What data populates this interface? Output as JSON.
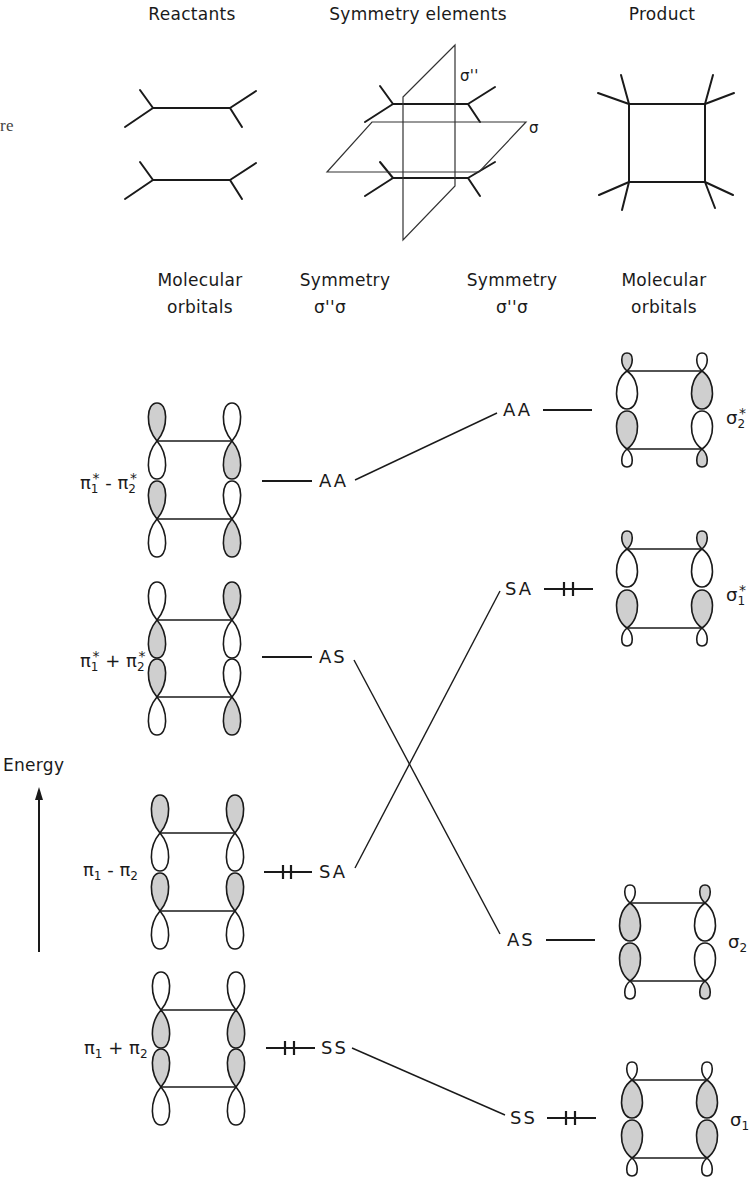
{
  "header": {
    "reactants": "Reactants",
    "symmetry_elements": "Symmetry elements",
    "product": "Product",
    "clipped_margin_text": "re"
  },
  "planes": {
    "sigma_double_prime": "σ''",
    "sigma": "σ"
  },
  "column_headers": {
    "left_mo_line1": "Molecular",
    "left_mo_line2": "orbitals",
    "left_sym_line1": "Symmetry",
    "left_sym_line2": "σ''σ",
    "right_sym_line1": "Symmetry",
    "right_sym_line2": "σ''σ",
    "right_mo_line1": "Molecular",
    "right_mo_line2": "orbitals"
  },
  "axis": {
    "label": "Energy"
  },
  "reactant_levels": [
    {
      "mo_base": "π",
      "sub1": "1",
      "sup1": "*",
      "op": "-",
      "sub2": "2",
      "sup2": "*",
      "symmetry": "AA",
      "electrons": 0
    },
    {
      "mo_base": "π",
      "sub1": "1",
      "sup1": "*",
      "op": "+",
      "sub2": "2",
      "sup2": "*",
      "symmetry": "AS",
      "electrons": 0
    },
    {
      "mo_base": "π",
      "sub1": "1",
      "sup1": "",
      "op": "-",
      "sub2": "2",
      "sup2": "",
      "symmetry": "SA",
      "electrons": 2
    },
    {
      "mo_base": "π",
      "sub1": "1",
      "sup1": "",
      "op": "+",
      "sub2": "2",
      "sup2": "",
      "symmetry": "SS",
      "electrons": 2
    }
  ],
  "product_levels": [
    {
      "mo_base": "σ",
      "sub": "2",
      "sup": "*",
      "symmetry": "AA",
      "electrons": 0
    },
    {
      "mo_base": "σ",
      "sub": "1",
      "sup": "*",
      "symmetry": "SA",
      "electrons": 2
    },
    {
      "mo_base": "σ",
      "sub": "2",
      "sup": "",
      "symmetry": "AS",
      "electrons": 0
    },
    {
      "mo_base": "σ",
      "sub": "1",
      "sup": "",
      "symmetry": "SS",
      "electrons": 0
    }
  ],
  "correlations": [
    {
      "from": "AA",
      "to": "AA"
    },
    {
      "from": "AS",
      "to": "AS"
    },
    {
      "from": "SA",
      "to": "SA"
    },
    {
      "from": "SS",
      "to": "SS"
    }
  ],
  "colors": {
    "line": "#1a1a1a",
    "shaded_lobe": "#cfcfcf",
    "background": "#ffffff"
  }
}
